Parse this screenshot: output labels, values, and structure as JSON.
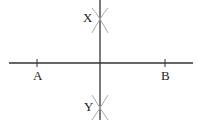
{
  "diagram": {
    "type": "perpendicular-bisector-construction",
    "colors": {
      "line": "#333333",
      "arc": "#aaaaaa",
      "text": "#222222"
    },
    "segment": {
      "x1": 9,
      "x2": 193,
      "y": 63
    },
    "bisector": {
      "x": 100,
      "y1": 0,
      "y2": 120
    },
    "points": [
      {
        "id": "A",
        "label": "A",
        "x": 37,
        "y": 63,
        "label_x": 33,
        "label_y": 80
      },
      {
        "id": "B",
        "label": "B",
        "x": 165,
        "y": 63,
        "label_x": 161,
        "label_y": 80
      },
      {
        "id": "X",
        "label": "X",
        "x": 100,
        "y": 21,
        "label_x": 83,
        "label_y": 22
      },
      {
        "id": "Y",
        "label": "Y",
        "x": 100,
        "y": 107,
        "label_x": 84,
        "label_y": 111
      }
    ]
  }
}
